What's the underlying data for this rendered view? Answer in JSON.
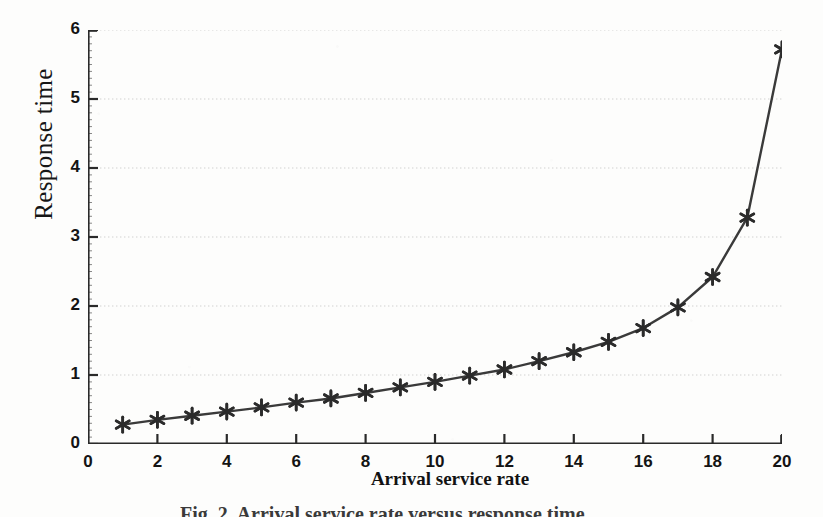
{
  "figure": {
    "caption": "Fig. 2. Arrival service rate versus response time"
  },
  "chart_data": {
    "type": "line",
    "title": "",
    "subtitle": "",
    "xlabel": "Arrival service rate",
    "ylabel": "Response time",
    "xlim": [
      0,
      20
    ],
    "ylim": [
      0,
      6
    ],
    "xticks": [
      0,
      2,
      4,
      6,
      8,
      10,
      12,
      14,
      16,
      18,
      20
    ],
    "xtick_labels": [
      "0",
      "2",
      "4",
      "6",
      "8",
      "10",
      "12",
      "14",
      "16",
      "18",
      "20"
    ],
    "yticks": [
      0,
      1,
      2,
      3,
      4,
      5,
      6
    ],
    "ytick_labels": [
      "0",
      "1",
      "2",
      "3",
      "4",
      "5",
      "6"
    ],
    "grid": "horizontal-dotted",
    "legend": "none",
    "marker": "asterisk",
    "line_color": "#3a3a3a",
    "marker_color": "#2b2b2b",
    "grid_color": "#c9c9c9",
    "axis_color": "#2a2a2a",
    "x": [
      1,
      2,
      3,
      4,
      5,
      6,
      7,
      8,
      9,
      10,
      11,
      12,
      13,
      14,
      15,
      16,
      17,
      18,
      19,
      20
    ],
    "series": [
      {
        "name": "Response time",
        "values": [
          0.28,
          0.35,
          0.41,
          0.47,
          0.53,
          0.6,
          0.66,
          0.74,
          0.82,
          0.9,
          0.99,
          1.08,
          1.2,
          1.33,
          1.48,
          1.68,
          1.98,
          2.42,
          3.28,
          5.72
        ]
      }
    ]
  }
}
